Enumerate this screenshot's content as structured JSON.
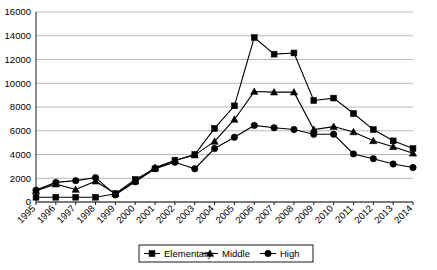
{
  "chart_data": {
    "type": "line",
    "title": "",
    "subtitle": "",
    "xlabel": "",
    "ylabel": "",
    "grid": true,
    "legend_position": "bottom-center",
    "ylim": [
      0,
      16000
    ],
    "ytick_step": 2000,
    "yticks": [
      "0",
      "2000",
      "4000",
      "6000",
      "8000",
      "10000",
      "12000",
      "14000",
      "16000"
    ],
    "categories": [
      "1995",
      "1996",
      "1997",
      "1998",
      "1999",
      "2000",
      "2001",
      "2002",
      "2003",
      "2004",
      "2005",
      "2006",
      "2007",
      "2008",
      "2009",
      "2010",
      "2011",
      "2012",
      "2013",
      "2014"
    ],
    "series": [
      {
        "name": "Elementary",
        "marker": "square",
        "color": "#000000",
        "values": [
          400,
          400,
          400,
          400,
          700,
          1900,
          2800,
          3500,
          4000,
          6200,
          8100,
          13850,
          12450,
          12550,
          8550,
          8750,
          7450,
          6100,
          5150,
          4500
        ]
      },
      {
        "name": "Middle",
        "marker": "triangle",
        "color": "#000000",
        "values": [
          950,
          1500,
          1050,
          1750,
          700,
          1750,
          2900,
          3500,
          3950,
          5100,
          6950,
          9300,
          9250,
          9250,
          6100,
          6350,
          5900,
          5150,
          4650,
          4100
        ]
      },
      {
        "name": "High",
        "marker": "circle",
        "color": "#000000",
        "values": [
          1000,
          1650,
          1800,
          2050,
          600,
          1700,
          2800,
          3350,
          2800,
          4500,
          5450,
          6450,
          6250,
          6100,
          5700,
          5700,
          4050,
          3650,
          3200,
          2900
        ]
      }
    ],
    "legend_entries": [
      "Elementary",
      "Middle",
      "High"
    ]
  }
}
